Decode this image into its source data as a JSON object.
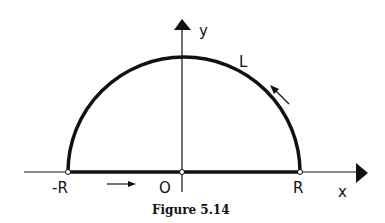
{
  "figure": {
    "caption": "Figure 5.14",
    "axes": {
      "x_label": "x",
      "y_label": "y"
    },
    "points": {
      "left": "-R",
      "origin": "O",
      "right": "R"
    },
    "curve_label": "L",
    "colors": {
      "ink": "#111111",
      "background": "#ffffff"
    }
  }
}
